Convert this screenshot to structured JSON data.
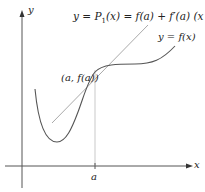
{
  "figure": {
    "axes": {
      "x_label": "x",
      "y_label": "y",
      "tick_label": "a"
    },
    "labels": {
      "tangent_eq_prefix": "y = ",
      "tangent_eq_P": "P",
      "tangent_eq_sub": "1",
      "tangent_eq_rest": "(x) = f(a) + f′(a) (x − a)",
      "curve_label": "y = f(x)",
      "point_label": "(a, f(a))"
    },
    "colors": {
      "axis": "#555555",
      "curve": "#555555",
      "tangent": "#aaaaaa",
      "guide": "#bbbbbb",
      "text": "#222222"
    }
  }
}
